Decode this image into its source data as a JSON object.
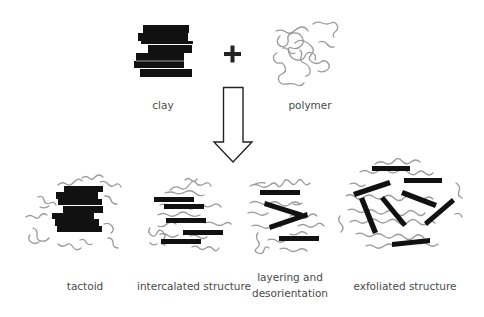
{
  "diagram": {
    "inputs": {
      "clay_label": "clay",
      "operator": "+",
      "polymer_label": "polymer"
    },
    "arrow": "down-arrow",
    "outcomes": [
      {
        "id": "tactoid",
        "label_lines": [
          "tactoid"
        ]
      },
      {
        "id": "intercalated",
        "label_lines": [
          "intercalated structure"
        ]
      },
      {
        "id": "layering",
        "label_lines": [
          "layering and",
          "desorientation"
        ]
      },
      {
        "id": "exfoliated",
        "label_lines": [
          "exfoliated structure"
        ]
      }
    ],
    "colors": {
      "clay": "#111111",
      "polymer": "#9a9a9a",
      "text": "#4a4a4a",
      "arrow": "#222222"
    }
  }
}
